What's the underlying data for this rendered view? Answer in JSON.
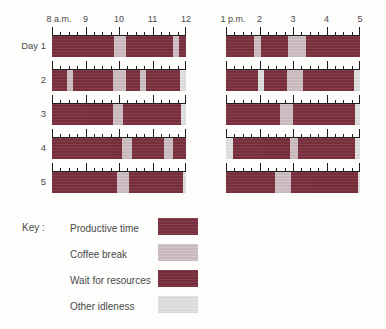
{
  "chart_data": {
    "type": "bar",
    "title": "",
    "xlabel": "",
    "ylabel": "",
    "grid": false,
    "legend_position": "bottom-left",
    "morning_axis": {
      "labels": [
        "8 a.m.",
        "9",
        "10",
        "11",
        "12"
      ],
      "range": [
        8,
        12
      ],
      "tick_interval_minor_minutes": 15
    },
    "afternoon_axis": {
      "labels": [
        "1 p.m.",
        "2",
        "3",
        "4",
        "5"
      ],
      "range": [
        13,
        17
      ],
      "tick_interval_minor_minutes": 15
    },
    "categories": [
      "Day 1",
      "2",
      "3",
      "4",
      "5"
    ],
    "series": [
      {
        "name": "Day 1",
        "morning": [
          {
            "type": "productive",
            "start": 8.0,
            "end": 9.85
          },
          {
            "type": "coffee",
            "start": 9.85,
            "end": 10.2
          },
          {
            "type": "productive",
            "start": 10.2,
            "end": 11.6
          },
          {
            "type": "coffee",
            "start": 11.6,
            "end": 11.78
          },
          {
            "type": "productive",
            "start": 11.78,
            "end": 12.0
          }
        ],
        "afternoon": [
          {
            "type": "productive",
            "start": 13.0,
            "end": 13.85
          },
          {
            "type": "coffee",
            "start": 13.85,
            "end": 14.05
          },
          {
            "type": "productive",
            "start": 14.05,
            "end": 14.85
          },
          {
            "type": "coffee",
            "start": 14.85,
            "end": 15.4
          },
          {
            "type": "productive",
            "start": 15.4,
            "end": 17.0
          }
        ]
      },
      {
        "name": "2",
        "morning": [
          {
            "type": "productive",
            "start": 8.0,
            "end": 8.45
          },
          {
            "type": "coffee",
            "start": 8.45,
            "end": 8.62
          },
          {
            "type": "productive",
            "start": 8.62,
            "end": 9.82
          },
          {
            "type": "coffee",
            "start": 9.82,
            "end": 10.2
          },
          {
            "type": "productive",
            "start": 10.2,
            "end": 10.62
          },
          {
            "type": "coffee",
            "start": 10.62,
            "end": 10.8
          },
          {
            "type": "productive",
            "start": 10.8,
            "end": 11.82
          },
          {
            "type": "idle",
            "start": 11.82,
            "end": 12.0
          }
        ],
        "afternoon": [
          {
            "type": "productive",
            "start": 13.0,
            "end": 13.95
          },
          {
            "type": "idle",
            "start": 13.95,
            "end": 14.12
          },
          {
            "type": "productive",
            "start": 14.12,
            "end": 14.82
          },
          {
            "type": "coffee",
            "start": 14.82,
            "end": 15.3
          },
          {
            "type": "productive",
            "start": 15.3,
            "end": 16.82
          },
          {
            "type": "idle",
            "start": 16.82,
            "end": 17.0
          }
        ]
      },
      {
        "name": "3",
        "morning": [
          {
            "type": "productive",
            "start": 8.0,
            "end": 9.0
          },
          {
            "type": "wait",
            "start": 9.0,
            "end": 9.82
          },
          {
            "type": "coffee",
            "start": 9.82,
            "end": 10.12
          },
          {
            "type": "productive",
            "start": 10.12,
            "end": 11.85
          },
          {
            "type": "idle",
            "start": 11.85,
            "end": 12.0
          }
        ],
        "afternoon": [
          {
            "type": "productive",
            "start": 13.0,
            "end": 14.6
          },
          {
            "type": "coffee",
            "start": 14.6,
            "end": 15.0
          },
          {
            "type": "productive",
            "start": 15.0,
            "end": 16.85
          },
          {
            "type": "idle",
            "start": 16.85,
            "end": 17.0
          }
        ]
      },
      {
        "name": "4",
        "morning": [
          {
            "type": "productive",
            "start": 8.0,
            "end": 9.8
          },
          {
            "type": "wait",
            "start": 9.8,
            "end": 10.1
          },
          {
            "type": "coffee",
            "start": 10.1,
            "end": 10.4
          },
          {
            "type": "productive",
            "start": 10.4,
            "end": 11.35
          },
          {
            "type": "coffee",
            "start": 11.35,
            "end": 11.6
          },
          {
            "type": "productive",
            "start": 11.6,
            "end": 12.0
          }
        ],
        "afternoon": [
          {
            "type": "idle",
            "start": 13.0,
            "end": 13.2
          },
          {
            "type": "productive",
            "start": 13.2,
            "end": 14.1
          },
          {
            "type": "wait",
            "start": 14.1,
            "end": 14.9
          },
          {
            "type": "coffee",
            "start": 14.9,
            "end": 15.15
          },
          {
            "type": "productive",
            "start": 15.15,
            "end": 16.85
          },
          {
            "type": "idle",
            "start": 16.85,
            "end": 17.0
          }
        ]
      },
      {
        "name": "5",
        "morning": [
          {
            "type": "productive",
            "start": 8.0,
            "end": 9.95
          },
          {
            "type": "coffee",
            "start": 9.95,
            "end": 10.3
          },
          {
            "type": "productive",
            "start": 10.3,
            "end": 11.9
          },
          {
            "type": "idle",
            "start": 11.9,
            "end": 12.0
          }
        ],
        "afternoon": [
          {
            "type": "productive",
            "start": 13.0,
            "end": 14.45
          },
          {
            "type": "coffee",
            "start": 14.45,
            "end": 14.95
          },
          {
            "type": "productive",
            "start": 14.95,
            "end": 15.6
          },
          {
            "type": "wait",
            "start": 15.6,
            "end": 16.95
          },
          {
            "type": "idle",
            "start": 16.95,
            "end": 17.0
          }
        ]
      }
    ],
    "legend": [
      {
        "label": "Productive time",
        "type": "productive",
        "color": "#7c3140"
      },
      {
        "label": "Coffee break",
        "type": "coffee",
        "color": "#cfc0c4"
      },
      {
        "label": "Wait for resources",
        "type": "wait",
        "color": "#7a2e3d"
      },
      {
        "label": "Other idleness",
        "type": "idle",
        "color": "#e2e2e2"
      }
    ]
  },
  "key": {
    "title": "Key :"
  }
}
